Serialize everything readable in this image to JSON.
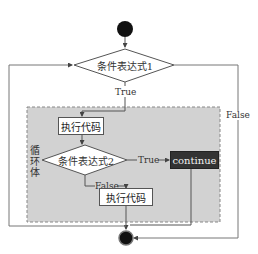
{
  "diagram": {
    "type": "flowchart",
    "nodes": {
      "start": {
        "shape": "circle",
        "fill": "#111111"
      },
      "condition1": {
        "shape": "diamond",
        "label": "条件表达式1"
      },
      "loop_body": {
        "shape": "region",
        "label": "循环体",
        "fill": "#cfcfcf"
      },
      "exec1": {
        "shape": "rect",
        "label": "执行代码"
      },
      "condition2": {
        "shape": "diamond",
        "label": "条件表达式2"
      },
      "continue": {
        "shape": "rect",
        "label": "continue",
        "fill": "#333333"
      },
      "exec2": {
        "shape": "rect",
        "label": "执行代码"
      },
      "end": {
        "shape": "circle",
        "fill": "#111111"
      }
    },
    "edges": {
      "cond1_true": "True",
      "cond1_false": "False",
      "cond2_true": "True",
      "cond2_false": "False"
    }
  }
}
